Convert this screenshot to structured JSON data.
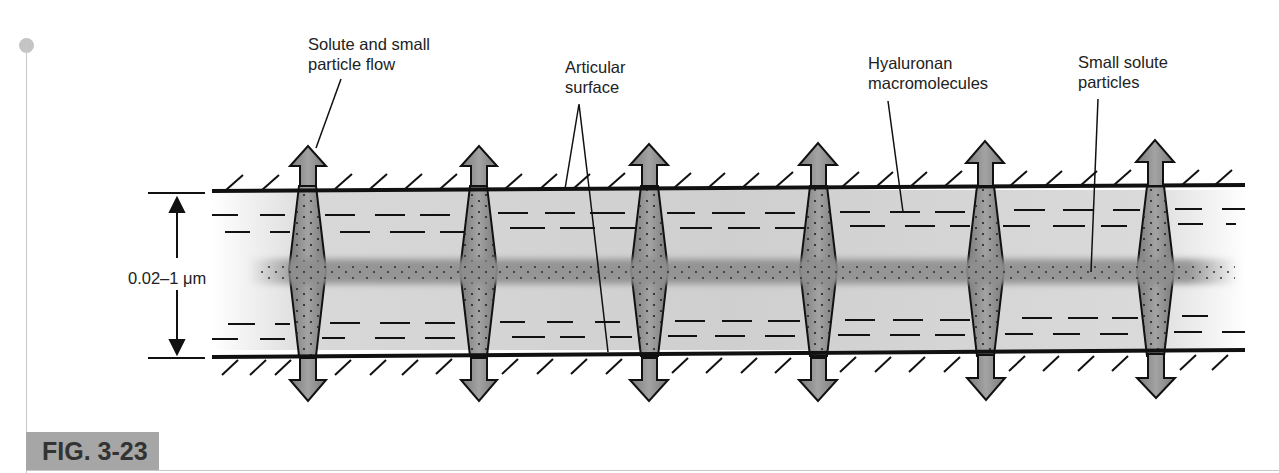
{
  "figure": {
    "label": "FIG. 3-23",
    "accent_color": "#a6a6a6"
  },
  "labels": {
    "solute_flow_line1": "Solute and small",
    "solute_flow_line2": "particle flow",
    "articular_line1": "Articular",
    "articular_line2": "surface",
    "hyaluronan_line1": "Hyaluronan",
    "hyaluronan_line2": "macromolecules",
    "small_solute_line1": "Small solute",
    "small_solute_line2": "particles",
    "gap_dimension": "0.02–1 μm"
  },
  "diagram": {
    "arrow_count": 6,
    "arrow_x_positions": [
      307,
      478,
      649,
      818,
      985,
      1155
    ],
    "fluid_color": "#d6d6d6",
    "particle_band_color": "#8a8a8a",
    "arrow_fill": "#8c8c8c"
  }
}
